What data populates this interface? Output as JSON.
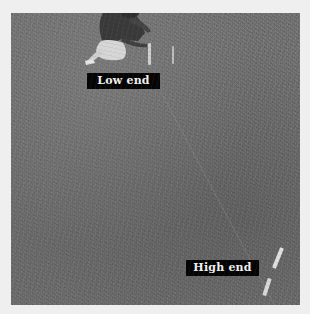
{
  "photo": {
    "description": "Black-and-white photo of a lawn with a kneeling person setting stakes and a string line",
    "labels": {
      "low_end": "Low end",
      "high_end": "High end"
    }
  },
  "colors": {
    "page_background": "#efefef",
    "grass_tone": "#707070",
    "label_background": "#050505",
    "label_text": "#f2f2f2"
  }
}
